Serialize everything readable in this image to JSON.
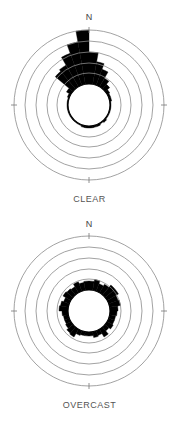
{
  "chart_data": [
    {
      "type": "polar-bar",
      "title": "CLEAR",
      "north_label": "N",
      "angle_step_deg": 10,
      "angles_deg": [
        0,
        10,
        20,
        30,
        40,
        50,
        60,
        70,
        80,
        90,
        100,
        110,
        120,
        130,
        140,
        150,
        160,
        170,
        180,
        190,
        200,
        210,
        220,
        230,
        240,
        250,
        260,
        270,
        280,
        290,
        300,
        310,
        320,
        330,
        340,
        350
      ],
      "inner_radius": 21,
      "ring_radii": [
        32,
        42,
        53,
        64,
        75
      ],
      "values": [
        53,
        44,
        38,
        31,
        27,
        24,
        23,
        23,
        22,
        22,
        22,
        22,
        22,
        23,
        22,
        23,
        23,
        23,
        23,
        23,
        22,
        22,
        22,
        22,
        22,
        22,
        22,
        22,
        22,
        23,
        26,
        44,
        46,
        55,
        64,
        75
      ],
      "grid": true,
      "color": "#000000"
    },
    {
      "type": "polar-bar",
      "title": "OVERCAST",
      "north_label": "N",
      "angle_step_deg": 10,
      "angles_deg": [
        0,
        10,
        20,
        30,
        40,
        50,
        60,
        70,
        80,
        90,
        100,
        110,
        120,
        130,
        140,
        150,
        160,
        170,
        180,
        190,
        200,
        210,
        220,
        230,
        240,
        250,
        260,
        270,
        280,
        290,
        300,
        310,
        320,
        330,
        340,
        350
      ],
      "inner_radius": 21,
      "ring_radii": [
        32,
        42,
        53,
        64,
        75
      ],
      "values": [
        30,
        32,
        29,
        31,
        34,
        34,
        31,
        32,
        29,
        28,
        27,
        27,
        28,
        26,
        30,
        26,
        27,
        25,
        25,
        25,
        26,
        30,
        29,
        27,
        26,
        26,
        27,
        30,
        29,
        27,
        30,
        29,
        28,
        31,
        29,
        30
      ],
      "grid": true,
      "color": "#000000"
    }
  ],
  "panels": {
    "clear": {
      "label": "CLEAR",
      "north": "N"
    },
    "overcast": {
      "label": "OVERCAST",
      "north": "N"
    }
  }
}
